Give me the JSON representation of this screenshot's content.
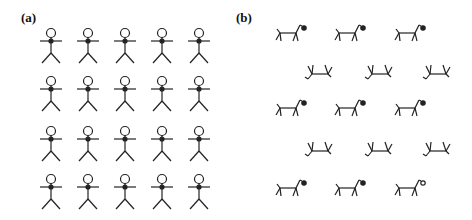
{
  "panels": [
    {
      "label": "(a)",
      "figure": "stick-human",
      "rows": 4,
      "cols": 5
    },
    {
      "label": "(b)",
      "figure": "stick-dog",
      "rows": 5,
      "cols": 3
    }
  ],
  "colors": {
    "stroke": "#222222",
    "background": "#ffffff"
  }
}
